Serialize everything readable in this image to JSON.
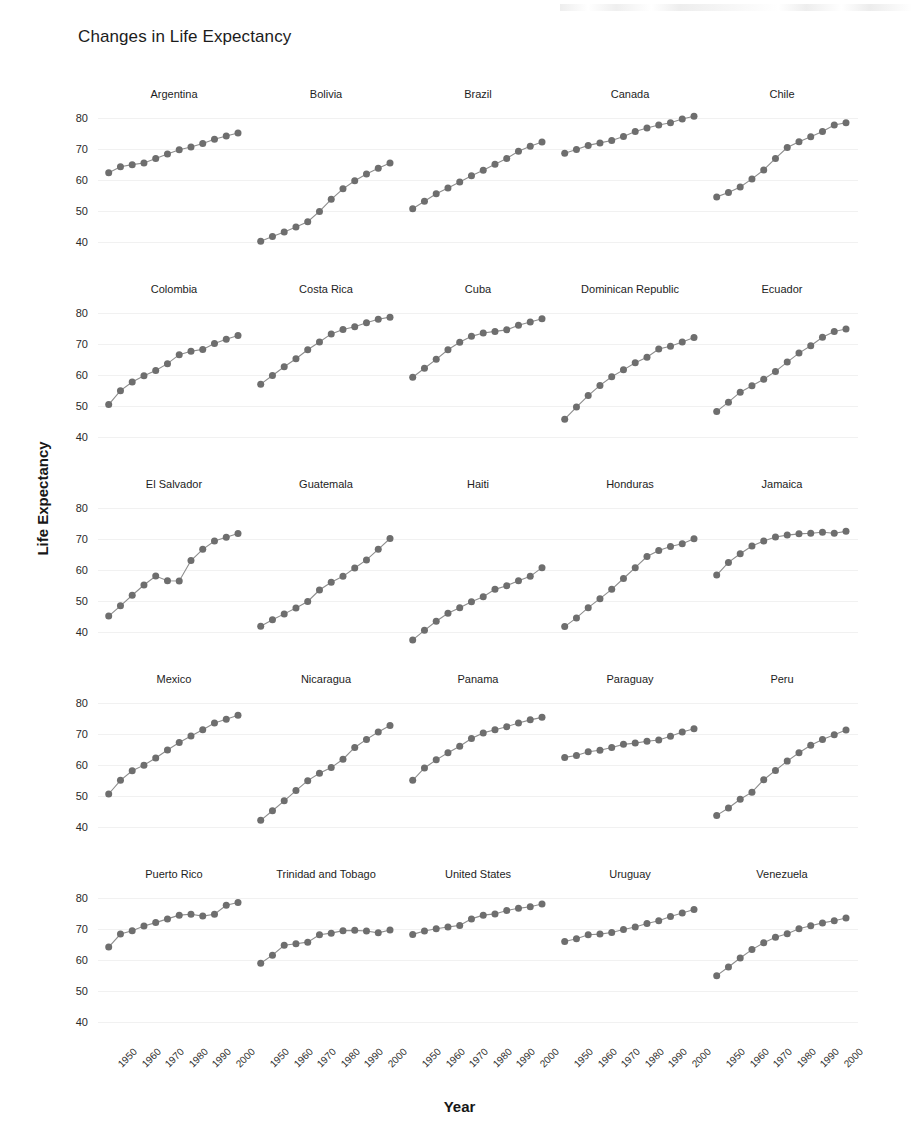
{
  "chart_data": {
    "type": "line",
    "title": "Changes in Life Expectancy",
    "xlabel": "Year",
    "ylabel": "Life Expectancy",
    "ylim": [
      35,
      84
    ],
    "xlim": [
      1950,
      2007
    ],
    "yticks": [
      40,
      50,
      60,
      70,
      80
    ],
    "xticks": [
      1950,
      1960,
      1970,
      1980,
      1990,
      2000
    ],
    "grid": true,
    "legend": "none",
    "marker": "filled-circle",
    "layout": {
      "rows": 5,
      "cols": 5,
      "facet_by": "country"
    },
    "x": [
      1952,
      1957,
      1962,
      1967,
      1972,
      1977,
      1982,
      1987,
      1992,
      1997,
      2002,
      2007
    ],
    "panels": [
      {
        "name": "Argentina",
        "values": [
          62.5,
          64.4,
          65.1,
          65.6,
          67.1,
          68.5,
          69.9,
          70.8,
          71.9,
          73.3,
          74.3,
          75.3
        ]
      },
      {
        "name": "Bolivia",
        "values": [
          40.4,
          41.9,
          43.4,
          45.0,
          46.7,
          50.0,
          53.9,
          57.3,
          59.9,
          62.1,
          63.9,
          65.6
        ]
      },
      {
        "name": "Brazil",
        "values": [
          50.9,
          53.3,
          55.7,
          57.6,
          59.5,
          61.5,
          63.3,
          65.2,
          67.1,
          69.4,
          71.0,
          72.4
        ]
      },
      {
        "name": "Canada",
        "values": [
          68.8,
          70.0,
          71.3,
          72.1,
          72.9,
          74.2,
          75.8,
          76.9,
          77.9,
          78.6,
          79.8,
          80.7
        ]
      },
      {
        "name": "Chile",
        "values": [
          54.7,
          56.1,
          57.9,
          60.5,
          63.4,
          67.1,
          70.6,
          72.5,
          74.1,
          75.8,
          77.9,
          78.6
        ]
      },
      {
        "name": "Colombia",
        "values": [
          50.6,
          55.1,
          57.9,
          59.9,
          61.6,
          63.8,
          66.7,
          67.8,
          68.4,
          70.3,
          71.7,
          72.9
        ]
      },
      {
        "name": "Costa Rica",
        "values": [
          57.2,
          60.0,
          62.8,
          65.4,
          68.3,
          70.8,
          73.4,
          74.8,
          75.7,
          77.0,
          78.1,
          78.8
        ]
      },
      {
        "name": "Cuba",
        "values": [
          59.4,
          62.3,
          65.2,
          68.3,
          70.7,
          72.6,
          73.7,
          74.2,
          74.7,
          76.2,
          77.2,
          78.3
        ]
      },
      {
        "name": "Dominican Republic",
        "values": [
          45.9,
          49.8,
          53.5,
          56.8,
          59.6,
          61.8,
          64.1,
          65.9,
          68.5,
          69.4,
          70.8,
          72.2
        ]
      },
      {
        "name": "Ecuador",
        "values": [
          48.4,
          51.4,
          54.6,
          56.7,
          58.8,
          61.3,
          64.3,
          67.2,
          69.6,
          72.3,
          74.2,
          75.0
        ]
      },
      {
        "name": "El Salvador",
        "values": [
          45.3,
          48.6,
          52.0,
          55.3,
          58.2,
          56.7,
          56.6,
          63.2,
          66.8,
          69.5,
          70.7,
          71.9
        ]
      },
      {
        "name": "Guatemala",
        "values": [
          42.0,
          44.1,
          46.0,
          47.9,
          50.0,
          53.7,
          56.2,
          58.1,
          60.8,
          63.4,
          66.8,
          70.3
        ]
      },
      {
        "name": "Haiti",
        "values": [
          37.6,
          40.7,
          43.6,
          46.2,
          48.0,
          49.9,
          51.5,
          53.9,
          55.1,
          56.7,
          58.1,
          60.9
        ]
      },
      {
        "name": "Honduras",
        "values": [
          41.9,
          44.7,
          48.0,
          50.9,
          53.9,
          57.4,
          60.9,
          64.5,
          66.4,
          67.7,
          68.6,
          70.2
        ]
      },
      {
        "name": "Jamaica",
        "values": [
          58.5,
          62.6,
          65.4,
          67.9,
          69.5,
          70.8,
          71.4,
          71.8,
          72.0,
          72.3,
          72.0,
          72.6
        ]
      },
      {
        "name": "Mexico",
        "values": [
          50.8,
          55.2,
          58.3,
          60.1,
          62.4,
          65.0,
          67.4,
          69.5,
          71.5,
          73.7,
          74.9,
          76.2
        ]
      },
      {
        "name": "Nicaragua",
        "values": [
          42.3,
          45.4,
          48.6,
          51.9,
          55.1,
          57.5,
          59.3,
          62.0,
          65.8,
          68.4,
          70.8,
          72.9
        ]
      },
      {
        "name": "Panama",
        "values": [
          55.2,
          59.2,
          61.8,
          64.1,
          66.2,
          68.7,
          70.5,
          71.5,
          72.5,
          73.7,
          74.7,
          75.5
        ]
      },
      {
        "name": "Paraguay",
        "values": [
          62.6,
          63.2,
          64.4,
          64.9,
          65.8,
          66.8,
          67.2,
          67.8,
          68.2,
          69.4,
          70.8,
          71.8
        ]
      },
      {
        "name": "Peru",
        "values": [
          43.9,
          46.3,
          49.1,
          51.4,
          55.4,
          58.4,
          61.4,
          64.1,
          66.5,
          68.4,
          69.9,
          71.4
        ]
      },
      {
        "name": "Puerto Rico",
        "values": [
          64.3,
          68.5,
          69.6,
          71.1,
          72.2,
          73.4,
          74.6,
          74.9,
          74.3,
          74.9,
          77.8,
          78.7
        ]
      },
      {
        "name": "Trinidad and Tobago",
        "values": [
          59.1,
          61.7,
          64.9,
          65.4,
          65.9,
          68.3,
          68.8,
          69.6,
          69.7,
          69.5,
          68.9,
          69.8
        ]
      },
      {
        "name": "United States",
        "values": [
          68.4,
          69.5,
          70.2,
          70.8,
          71.3,
          73.4,
          74.6,
          75.0,
          76.1,
          76.8,
          77.3,
          78.2
        ]
      },
      {
        "name": "Uruguay",
        "values": [
          66.1,
          67.0,
          68.3,
          68.5,
          69.0,
          70.0,
          70.8,
          71.9,
          72.8,
          74.2,
          75.3,
          76.4
        ]
      },
      {
        "name": "Venezuela",
        "values": [
          55.1,
          57.9,
          60.8,
          63.5,
          65.7,
          67.5,
          68.6,
          70.2,
          71.2,
          72.1,
          72.8,
          73.7
        ]
      }
    ]
  },
  "figure": {
    "title": "Changes in Life Expectancy",
    "xlabel": "Year",
    "ylabel": "Life Expectancy",
    "point_color": "#6e6e6e",
    "line_color": "#8d8d8d",
    "background": "#ffffff"
  }
}
